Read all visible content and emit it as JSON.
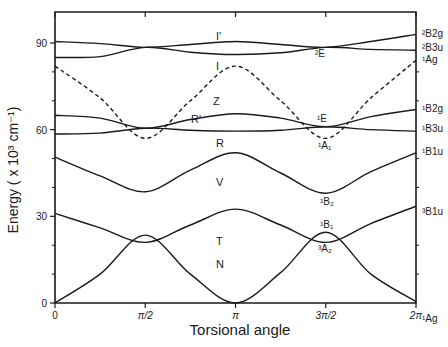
{
  "chart_data": {
    "type": "line",
    "title": "",
    "xlabel": "Torsional angle",
    "ylabel": "Energy ( x 10³ cm⁻¹)",
    "xlim": [
      0,
      6.2832
    ],
    "ylim": [
      0,
      100
    ],
    "grid": false,
    "legend": "none (curves labeled inline)",
    "x_ticks": [
      {
        "value": 0,
        "label": "0"
      },
      {
        "value": 1.5708,
        "label": "π/2"
      },
      {
        "value": 3.1416,
        "label": "π"
      },
      {
        "value": 4.7124,
        "label": "3π/2"
      },
      {
        "value": 6.2832,
        "label": "2π"
      }
    ],
    "y_ticks": [
      {
        "value": 0,
        "label": "0"
      },
      {
        "value": 30,
        "label": "30"
      },
      {
        "value": 60,
        "label": "60"
      },
      {
        "value": 90,
        "label": "90"
      }
    ],
    "y_minor_ticks": [
      10,
      20,
      40,
      50,
      70,
      80
    ],
    "x": [
      0,
      0.7854,
      1.5708,
      2.3562,
      3.1416,
      3.927,
      4.7124,
      5.4978,
      6.2832
    ],
    "series": [
      {
        "name": "I'",
        "style": "solid",
        "values": [
          90.5,
          89.8,
          88.5,
          89.5,
          90.5,
          89.5,
          88.5,
          90.5,
          93.0
        ]
      },
      {
        "name": "I",
        "style": "solid",
        "values": [
          85.0,
          85.3,
          88.5,
          86.8,
          86.0,
          86.6,
          88.5,
          87.8,
          87.5
        ]
      },
      {
        "name": "Z",
        "style": "dashed",
        "values": [
          82.0,
          71.0,
          57.0,
          70.0,
          82.0,
          70.0,
          57.0,
          71.0,
          84.0
        ]
      },
      {
        "name": "R'",
        "style": "solid",
        "values": [
          65.0,
          64.0,
          60.5,
          63.5,
          65.5,
          64.0,
          61.0,
          64.5,
          67.0
        ]
      },
      {
        "name": "R",
        "style": "solid",
        "values": [
          58.5,
          58.8,
          60.5,
          59.8,
          59.5,
          59.8,
          61.0,
          60.0,
          59.5
        ]
      },
      {
        "name": "V",
        "style": "solid",
        "values": [
          50.5,
          44.0,
          38.5,
          46.0,
          52.0,
          45.0,
          38.0,
          45.5,
          52.0
        ]
      },
      {
        "name": "T",
        "style": "solid",
        "values": [
          31.0,
          26.0,
          21.0,
          27.0,
          32.5,
          27.0,
          21.0,
          27.5,
          33.5
        ]
      },
      {
        "name": "N",
        "style": "solid",
        "values": [
          0.0,
          10.0,
          23.5,
          10.0,
          0.0,
          10.5,
          24.5,
          10.0,
          0.5
        ]
      }
    ],
    "annotations": {
      "inline_curve_labels": [
        {
          "text": "I'",
          "x": 4.25,
          "y": 93.5
        },
        {
          "text": "I",
          "x": 4.25,
          "y": 80.0
        },
        {
          "text": "Z",
          "x": 4.25,
          "y": 67.0
        },
        {
          "text": "R'",
          "x": 3.7,
          "y": 63.0
        },
        {
          "text": "R",
          "x": 4.2,
          "y": 55.0
        },
        {
          "text": "V",
          "x": 4.2,
          "y": 40.0
        },
        {
          "text": "T",
          "x": 4.2,
          "y": 20.0
        },
        {
          "text": "N",
          "x": 4.2,
          "y": 12.0
        }
      ],
      "symmetry_labels_mid": [
        {
          "text": "²E",
          "near": "3π/2, 86"
        },
        {
          "text": "¹E",
          "near": "3π/2, 64"
        },
        {
          "text": "¹A₁",
          "near": "3π/2, 54"
        },
        {
          "text": "¹B₂",
          "near": "3π/2, 34"
        },
        {
          "text": "¹B₁",
          "near": "3π/2, 26"
        },
        {
          "text": "³A₂",
          "near": "3π/2, 18"
        }
      ],
      "symmetry_labels_right": [
        {
          "text": "²B2g",
          "y": 93.0
        },
        {
          "text": "²B3u",
          "y": 87.5
        },
        {
          "text": "¹Ag",
          "y": 84.0
        },
        {
          "text": "¹B2g",
          "y": 67.0
        },
        {
          "text": "¹B3u",
          "y": 59.5
        },
        {
          "text": "¹B1u",
          "y": 52.0
        },
        {
          "text": "³B1u",
          "y": 33.5
        },
        {
          "text": "¹Ag",
          "y": 0.5
        }
      ]
    }
  },
  "labels": {
    "xlabel": "Torsional angle",
    "ylabel": "Energy ( x 10³ cm⁻¹)"
  }
}
